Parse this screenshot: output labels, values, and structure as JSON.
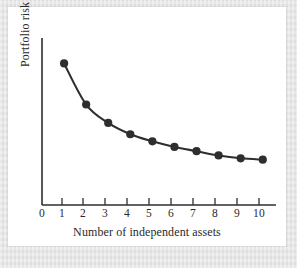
{
  "figure": {
    "background_color": "#e3e3e3",
    "card_color": "#ffffff",
    "ink_color": "#2a2a2a"
  },
  "chart_data": {
    "type": "line",
    "title": "",
    "xlabel": "Number of independent assets",
    "ylabel": "Portfolio risk",
    "x": [
      1,
      2,
      3,
      4,
      5,
      6,
      7,
      8,
      9,
      10
    ],
    "values": [
      100,
      71,
      58,
      50,
      45,
      41,
      38,
      35,
      33,
      32
    ],
    "xtick_labels": [
      "0",
      "1",
      "2",
      "3",
      "4",
      "5",
      "6",
      "7",
      "8",
      "9",
      "10"
    ],
    "xticks": [
      0,
      1,
      2,
      3,
      4,
      5,
      6,
      7,
      8,
      9,
      10
    ],
    "ytick_labels": [],
    "xlim": [
      0,
      10.6
    ],
    "ylim": [
      0,
      118
    ],
    "grid": false,
    "legend": false,
    "marker": "filled-circle",
    "marker_color": "#2e2e2e",
    "line_color": "#2e2e2e",
    "annotation": "Portfolio risk declines and flattens toward an asymptote as the number of independent assets increases"
  }
}
